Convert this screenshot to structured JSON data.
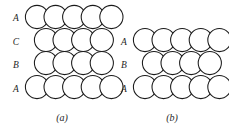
{
  "figure": {
    "background_color": "#ffffff",
    "line_color": "#1a1a1a",
    "sphere_fill": "#ffffff",
    "text_color": "#1f1f1f",
    "sphere_radius": 11.6,
    "panels": [
      {
        "id": "panel-a",
        "caption": "(a)",
        "caption_x": 62,
        "caption_y": 121,
        "label_x": 16,
        "stacking": "ABCABC",
        "layers": [
          {
            "label": "A",
            "label_y": 21,
            "row_y": 17,
            "count": 5,
            "start_x": 37,
            "step_x": 18.6
          },
          {
            "label": "C",
            "label_y": 45,
            "row_y": 40,
            "count": 4,
            "start_x": 46,
            "step_x": 18.6
          },
          {
            "label": "B",
            "label_y": 68,
            "row_y": 63,
            "count": 4,
            "start_x": 46,
            "step_x": 18.6
          },
          {
            "label": "A",
            "label_y": 92,
            "row_y": 87,
            "count": 5,
            "start_x": 37,
            "step_x": 18.6
          }
        ]
      },
      {
        "id": "panel-b",
        "caption": "(b)",
        "caption_x": 172,
        "caption_y": 121,
        "label_x": 124,
        "stacking": "ABAB",
        "layers": [
          {
            "label": "A",
            "label_y": 45,
            "row_y": 40,
            "count": 5,
            "start_x": 145,
            "step_x": 18.6
          },
          {
            "label": "B",
            "label_y": 68,
            "row_y": 63,
            "count": 4,
            "start_x": 154,
            "step_x": 18.6
          },
          {
            "label": "A",
            "label_y": 92,
            "row_y": 87,
            "count": 5,
            "start_x": 145,
            "step_x": 18.6
          }
        ]
      }
    ]
  }
}
